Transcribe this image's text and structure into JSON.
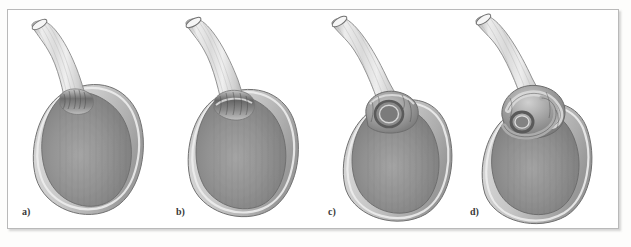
{
  "figure": {
    "kind": "anatomical-illustration",
    "medium": "grayscale line-and-tone drawing",
    "panel_count": 4,
    "frame": {
      "border_color": "#b9b9b9",
      "background_color": "#ffffff",
      "shadow_color": "#787878"
    },
    "palette": {
      "outline": "#6f6f6f",
      "wall_light": "#d9d9d9",
      "wall_mid": "#bdbdbd",
      "wall_shadow": "#9a9a9a",
      "lumen_dark": "#7f7f7f",
      "lumen_mid": "#8e8e8e",
      "lumen_highlight": "#a8a8a8",
      "duct_light": "#ececec",
      "duct_stripe": "#c6c6c6",
      "neck_dark": "#6a6a6a",
      "label_color": "#3a3a3a"
    },
    "panels": [
      {
        "id": "a",
        "label": "a)",
        "description": "Gallbladder with a straight, patent cystic duct; neck shows normal mucosal folds"
      },
      {
        "id": "b",
        "label": "b)",
        "description": "Gallbladder with a slightly angulated neck; duct begins to fold against the fundus"
      },
      {
        "id": "c",
        "label": "c)",
        "description": "Gallbladder with a pronounced kink forming a closed loop at the neck"
      },
      {
        "id": "d",
        "label": "d)",
        "description": "Gallbladder with a fully twisted, coiled neck (torsion) obstructing the lumen"
      }
    ]
  }
}
